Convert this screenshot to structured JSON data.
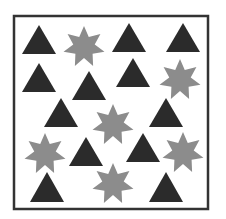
{
  "figure": {
    "width": 226,
    "height": 219,
    "background": "#ffffff",
    "frame": {
      "x": 14,
      "y": 16,
      "width": 194,
      "height": 193,
      "stroke": "#333333",
      "stroke_width": 2.5
    },
    "colors": {
      "triangle": "#2b2b2b",
      "star": "#8c8c8c"
    },
    "counts": {
      "triangles": 13,
      "stars": 7
    },
    "triangles": [
      {
        "cx": 39,
        "apex_y": 25,
        "base_y": 54,
        "half_w": 17
      },
      {
        "cx": 129,
        "apex_y": 23,
        "base_y": 52,
        "half_w": 17
      },
      {
        "cx": 183,
        "apex_y": 23,
        "base_y": 52,
        "half_w": 17
      },
      {
        "cx": 39,
        "apex_y": 63,
        "base_y": 92,
        "half_w": 17
      },
      {
        "cx": 89,
        "apex_y": 71,
        "base_y": 100,
        "half_w": 17
      },
      {
        "cx": 133,
        "apex_y": 58,
        "base_y": 87,
        "half_w": 17
      },
      {
        "cx": 61,
        "apex_y": 98,
        "base_y": 127,
        "half_w": 17
      },
      {
        "cx": 166,
        "apex_y": 98,
        "base_y": 127,
        "half_w": 17
      },
      {
        "cx": 86,
        "apex_y": 137,
        "base_y": 166,
        "half_w": 17
      },
      {
        "cx": 143,
        "apex_y": 133,
        "base_y": 162,
        "half_w": 17
      },
      {
        "cx": 47,
        "apex_y": 172,
        "base_y": 202,
        "half_w": 17
      },
      {
        "cx": 166,
        "apex_y": 172,
        "base_y": 202,
        "half_w": 17
      }
    ],
    "stars": [
      {
        "cx": 84,
        "cy": 47,
        "r_outer": 21,
        "r_inner": 11,
        "points": 7
      },
      {
        "cx": 180,
        "cy": 80,
        "r_outer": 21,
        "r_inner": 11,
        "points": 7
      },
      {
        "cx": 113,
        "cy": 125,
        "r_outer": 21,
        "r_inner": 11,
        "points": 7
      },
      {
        "cx": 45,
        "cy": 154,
        "r_outer": 21,
        "r_inner": 11,
        "points": 7
      },
      {
        "cx": 183,
        "cy": 153,
        "r_outer": 21,
        "r_inner": 11,
        "points": 7
      },
      {
        "cx": 113,
        "cy": 184,
        "r_outer": 21,
        "r_inner": 11,
        "points": 7
      }
    ]
  }
}
